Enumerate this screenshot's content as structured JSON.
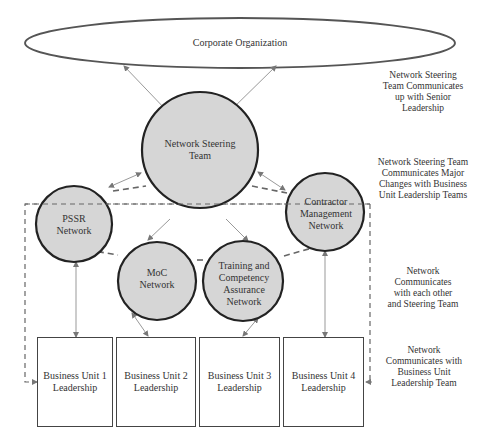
{
  "diagram": {
    "top_node": {
      "label": "Corporate Organization"
    },
    "steering": {
      "label": "Network Steering Team"
    },
    "networks": [
      {
        "id": "pssr",
        "label": "PSSR Network"
      },
      {
        "id": "contractor",
        "label": "Contractor Management Network"
      },
      {
        "id": "moc",
        "label": "MoC Network"
      },
      {
        "id": "training",
        "label": "Training and Competency Assurance Network"
      }
    ],
    "business_units": [
      {
        "label": "Business Unit 1 Leadership"
      },
      {
        "label": "Business Unit 2 Leadership"
      },
      {
        "label": "Business Unit 3 Leadership"
      },
      {
        "label": "Business Unit 4 Leadership"
      }
    ],
    "annotations": [
      {
        "text": "Network Steering Team Communicates up with Senior Leadership"
      },
      {
        "text": "Network Steering Team Communicates Major Changes with Business Unit Leadership Teams"
      },
      {
        "text": "Network Communicates with each other and Steering Team"
      },
      {
        "text": "Network Communicates with Business Unit Leadership Team"
      }
    ],
    "colors": {
      "node_fill": "#d6d6d6",
      "node_stroke": "#222222",
      "dash_stroke": "#666666",
      "arrow_stroke": "#999999"
    }
  }
}
